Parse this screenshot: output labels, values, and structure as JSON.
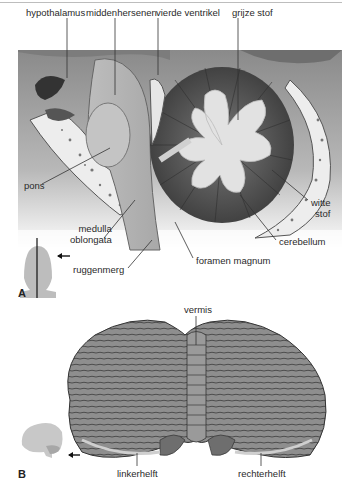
{
  "figure": {
    "panel_a": {
      "letter": "A",
      "view": "sagittal section",
      "labels": {
        "hypothalamus": "hypothalamus",
        "middenhersenen": "middenhersenen",
        "vierde_ventrikel": "vierde ventrikel",
        "grijze_stof": "grijze stof",
        "pons": "pons",
        "medulla_line1": "medulla",
        "medulla_line2": "oblongata",
        "ruggenmerg": "ruggenmerg",
        "foramen_magnum": "foramen magnum",
        "cerebellum": "cerebellum",
        "witte_line1": "witte",
        "witte_line2": "stof"
      },
      "orientation_icon": "head-front-midline-icon"
    },
    "panel_b": {
      "letter": "B",
      "view": "posterior view of cerebellum",
      "labels": {
        "vermis": "vermis",
        "linkerhelft": "linkerhelft",
        "rechterhelft": "rechterhelft"
      },
      "orientation_icon": "brain-side-icon"
    },
    "colors": {
      "background": "#ffffff",
      "tissue_light": "#c9c9c9",
      "tissue_mid": "#9a9a9a",
      "tissue_dark": "#4a4a4a",
      "bone": "#ececec",
      "label_text": "#2a2a2a",
      "leader_line": "#333333"
    }
  }
}
